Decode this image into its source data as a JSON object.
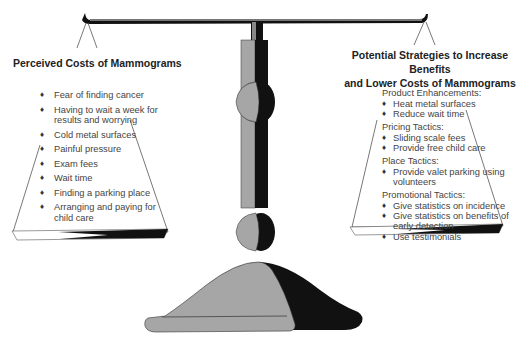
{
  "left_pan": {
    "title": "Perceived Costs of Mammograms",
    "items": [
      "Fear of finding cancer",
      "Having to wait a week for results and worrying",
      "Cold metal surfaces",
      "Painful pressure",
      "Exam fees",
      "Wait time",
      "Finding a parking place",
      "Arranging and paying for child care"
    ]
  },
  "right_pan": {
    "title_line1": "Potential Strategies to Increase Benefits",
    "title_line2": "and Lower Costs of Mammograms",
    "groups": [
      {
        "heading": "Product Enhancements:",
        "items": [
          "Heat metal surfaces",
          "Reduce wait time"
        ]
      },
      {
        "heading": "Pricing Tactics:",
        "items": [
          "Sliding scale fees",
          "Provide free child care"
        ]
      },
      {
        "heading": "Place Tactics:",
        "items": [
          "Provide valet parking using volunteers"
        ]
      },
      {
        "heading": "Promotional Tactics:",
        "items": [
          "Give statistics on incidence",
          "Give statistics on  benefits of early detection",
          "Use testimonials"
        ]
      }
    ]
  },
  "bullet_glyph": "♦",
  "colors": {
    "dark": "#111111",
    "gray": "#a6a6a6",
    "line": "#555555"
  }
}
